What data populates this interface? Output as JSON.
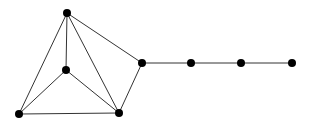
{
  "diagram": {
    "type": "graph",
    "width": 311,
    "height": 125,
    "node_color": "#000000",
    "edge_color": "#333333",
    "node_radius": 4,
    "nodes": [
      {
        "id": "top",
        "x": 67,
        "y": 13
      },
      {
        "id": "center",
        "x": 66,
        "y": 70
      },
      {
        "id": "bottom-left",
        "x": 19,
        "y": 114
      },
      {
        "id": "bottom-right",
        "x": 119,
        "y": 113
      },
      {
        "id": "hub",
        "x": 142,
        "y": 63
      },
      {
        "id": "chain-1",
        "x": 191,
        "y": 63
      },
      {
        "id": "chain-2",
        "x": 241,
        "y": 63
      },
      {
        "id": "chain-3",
        "x": 292,
        "y": 63
      }
    ],
    "edges": [
      [
        "top",
        "bottom-left"
      ],
      [
        "top",
        "center"
      ],
      [
        "top",
        "bottom-right"
      ],
      [
        "top",
        "hub"
      ],
      [
        "center",
        "bottom-left"
      ],
      [
        "center",
        "bottom-right"
      ],
      [
        "bottom-left",
        "bottom-right"
      ],
      [
        "bottom-right",
        "hub"
      ],
      [
        "hub",
        "chain-1"
      ],
      [
        "chain-1",
        "chain-2"
      ],
      [
        "chain-2",
        "chain-3"
      ]
    ]
  }
}
